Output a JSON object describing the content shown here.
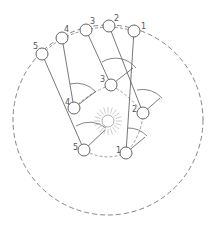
{
  "diagram": {
    "outer_positions": [
      {
        "label": "1"
      },
      {
        "label": "2"
      },
      {
        "label": "3"
      },
      {
        "label": "4"
      },
      {
        "label": "5"
      }
    ],
    "inner_positions": [
      {
        "label": "1"
      },
      {
        "label": "2"
      },
      {
        "label": "3"
      },
      {
        "label": "4"
      },
      {
        "label": "5"
      }
    ],
    "center": {
      "name": "sun"
    },
    "colors": {
      "stroke": "#555555",
      "dashed": "#777777",
      "sun": "#999999"
    }
  }
}
